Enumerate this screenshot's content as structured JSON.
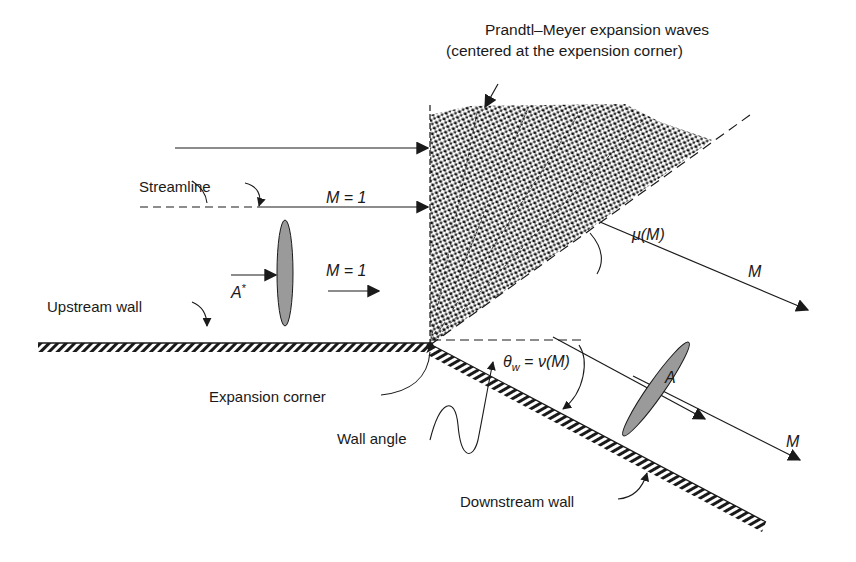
{
  "title": {
    "line1": "Prandtl–Meyer expansion waves",
    "line2": "(centered at the expension corner)"
  },
  "labels": {
    "streamline": "Streamline",
    "upstream_wall": "Upstream wall",
    "expansion_corner": "Expansion corner",
    "wall_angle": "Wall angle",
    "downstream_wall": "Downstream wall"
  },
  "symbols": {
    "mach_upper": "M = 1",
    "mach_lower": "M = 1",
    "a_star": "A",
    "a_star_sup": "*",
    "mu": "μ(M)",
    "theta_w": "θ",
    "theta_w_sub": "w",
    "theta_eq": " = ν(M)",
    "mach_down_upper": "M",
    "area_down": "A",
    "mach_down_lower": "M"
  },
  "colors": {
    "ink": "#1a1a1a",
    "ellipse_fill": "#9a9a9a",
    "fan_dot": "#111111",
    "background": "#ffffff"
  }
}
